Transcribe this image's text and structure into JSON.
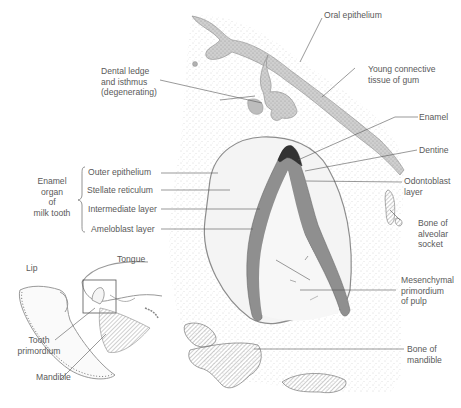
{
  "figure": {
    "labels": {
      "oral_epithelium": "Oral epithelium",
      "dental_ledge": [
        "Dental ledge",
        "and isthmus",
        "(degenerating)"
      ],
      "young_connective": [
        "Young connective",
        "tissue of gum"
      ],
      "enamel": "Enamel",
      "dentine": "Dentine",
      "odontoblast": [
        "Odontoblast",
        "layer"
      ],
      "bone_alveolar": [
        "Bone of",
        "alveolar",
        "socket"
      ],
      "mesenchymal": [
        "Mesenchymal",
        "primordium",
        "of pulp"
      ],
      "bone_mandible": [
        "Bone of",
        "mandible"
      ],
      "enamel_organ": [
        "Enamel",
        "organ",
        "of",
        "milk tooth"
      ],
      "outer_epithelium": "Outer epithelium",
      "stellate_reticulum": "Stellate reticulum",
      "intermediate_layer": "Intermediate layer",
      "ameloblast_layer": "Ameloblast layer"
    },
    "inset": {
      "lip": "Lip",
      "tongue": "Tongue",
      "tooth_primordium": [
        "Tooth",
        "primordium"
      ],
      "mandible": "Mandible"
    },
    "colors": {
      "ink": "#555555",
      "tissue": "#efefef",
      "epithelium": "#b9b9b9",
      "background": "#ffffff"
    }
  }
}
